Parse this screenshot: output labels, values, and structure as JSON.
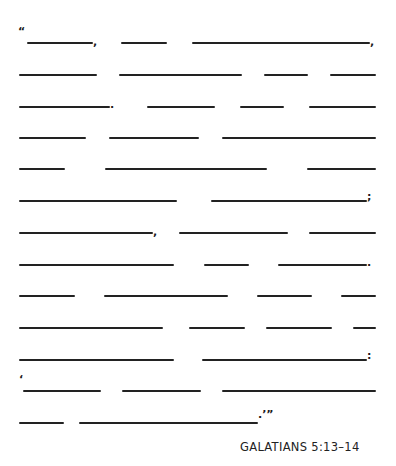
{
  "worksheet": {
    "type": "fill-in-the-blank scripture",
    "reference": "GALATIANS 5:13–14",
    "rows": [
      {
        "y": 42,
        "blanks": [
          [
            27,
            93
          ],
          [
            121,
            167
          ],
          [
            192,
            370
          ]
        ]
      },
      {
        "y": 74,
        "blanks": [
          [
            19,
            97
          ],
          [
            119,
            242
          ],
          [
            264,
            308
          ],
          [
            330,
            376
          ]
        ]
      },
      {
        "y": 106,
        "blanks": [
          [
            19,
            110
          ],
          [
            147,
            215
          ],
          [
            240,
            284
          ],
          [
            309,
            376
          ]
        ]
      },
      {
        "y": 137,
        "blanks": [
          [
            19,
            86
          ],
          [
            109,
            199
          ],
          [
            222,
            376
          ]
        ]
      },
      {
        "y": 168,
        "blanks": [
          [
            19,
            65
          ],
          [
            105,
            267
          ],
          [
            307,
            376
          ]
        ]
      },
      {
        "y": 200,
        "blanks": [
          [
            19,
            177
          ],
          [
            211,
            367
          ]
        ]
      },
      {
        "y": 232,
        "blanks": [
          [
            19,
            153
          ],
          [
            179,
            288
          ],
          [
            309,
            376
          ]
        ]
      },
      {
        "y": 264,
        "blanks": [
          [
            19,
            174
          ],
          [
            204,
            249
          ],
          [
            278,
            367
          ]
        ]
      },
      {
        "y": 295,
        "blanks": [
          [
            19,
            75
          ],
          [
            104,
            228
          ],
          [
            257,
            312
          ],
          [
            341,
            376
          ]
        ]
      },
      {
        "y": 327,
        "blanks": [
          [
            19,
            163
          ],
          [
            189,
            245
          ],
          [
            266,
            332
          ],
          [
            353,
            376
          ]
        ]
      },
      {
        "y": 359,
        "blanks": [
          [
            19,
            174
          ],
          [
            202,
            367
          ]
        ]
      },
      {
        "y": 390,
        "blanks": [
          [
            23,
            101
          ],
          [
            122,
            201
          ],
          [
            222,
            376
          ]
        ]
      },
      {
        "y": 422,
        "blanks": [
          [
            19,
            64
          ],
          [
            79,
            258
          ]
        ]
      }
    ],
    "punctuation": [
      {
        "char": "“",
        "x": 18,
        "y": 26
      },
      {
        "char": ",",
        "x": 93,
        "y": 36
      },
      {
        "char": ",",
        "x": 370,
        "y": 36
      },
      {
        "char": ".",
        "x": 110,
        "y": 99
      },
      {
        "char": ";",
        "x": 367,
        "y": 191
      },
      {
        "char": ",",
        "x": 153,
        "y": 226
      },
      {
        "char": ".",
        "x": 367,
        "y": 257
      },
      {
        "char": ":",
        "x": 367,
        "y": 350
      },
      {
        "char": "‘",
        "x": 19,
        "y": 374
      },
      {
        "char": ".’”",
        "x": 258,
        "y": 409
      }
    ]
  }
}
